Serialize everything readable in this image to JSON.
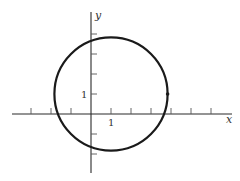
{
  "diagram": {
    "type": "coordinate-plane-circle",
    "axes": {
      "x_label": "x",
      "y_label": "y",
      "x_tick_label": "1",
      "y_tick_label": "1",
      "x_ticks": [
        -3,
        -2,
        -1,
        1,
        2,
        3,
        4,
        5,
        6
      ],
      "y_ticks": [
        -2,
        -1,
        1,
        2,
        3,
        4
      ],
      "x_range": [
        -4,
        7
      ],
      "y_range": [
        -3,
        5
      ]
    },
    "circle": {
      "center": [
        1,
        1
      ],
      "radius": 2.83,
      "equation": "(x-1)^2 + (y-1)^2 = 8"
    },
    "marked_point": {
      "coords": [
        3.83,
        1
      ]
    },
    "colors": {
      "curve": "#1a1a1a",
      "axis": "#2a2a2a",
      "background": "#ffffff"
    }
  }
}
